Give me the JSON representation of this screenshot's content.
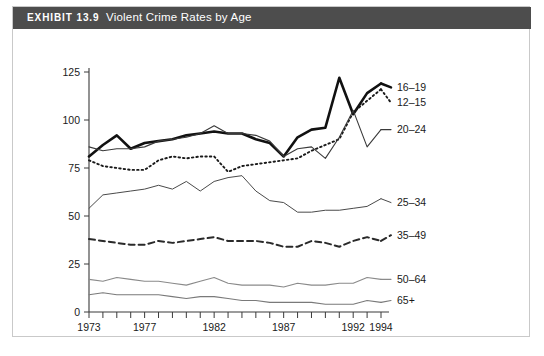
{
  "exhibit": {
    "label": "EXHIBIT 13.9",
    "name": "Violent Crime Rates by Age",
    "title_full": "EXHIBIT 13.9  Violent Crime Rates by Age",
    "header_bg": "#4d4d4d",
    "header_text_color": "#ffffff",
    "frame_border": "#c9c9c9",
    "page_bg": "#ffffff"
  },
  "chart_data": {
    "type": "line",
    "title": "Violent Crime Rates by Age",
    "xlabel": "",
    "ylabel": "",
    "xlim": [
      1973,
      1994
    ],
    "ylim": [
      0,
      125
    ],
    "yticks": [
      0,
      25,
      50,
      75,
      100,
      125
    ],
    "ytick_labels": [
      "0",
      "25",
      "50",
      "75",
      "100",
      "125"
    ],
    "x": [
      1973,
      1974,
      1975,
      1976,
      1977,
      1978,
      1979,
      1980,
      1981,
      1982,
      1983,
      1984,
      1985,
      1986,
      1987,
      1988,
      1989,
      1990,
      1991,
      1992,
      1993,
      1994
    ],
    "xticks": [
      1973,
      1974,
      1975,
      1976,
      1977,
      1978,
      1979,
      1980,
      1981,
      1982,
      1983,
      1984,
      1985,
      1986,
      1987,
      1988,
      1989,
      1990,
      1991,
      1992,
      1993,
      1994
    ],
    "xtick_labels_shown": [
      "1973",
      "1977",
      "1982",
      "1987",
      "1992",
      "1994"
    ],
    "xtick_labels_shown_at": [
      1973,
      1977,
      1982,
      1987,
      1992,
      1994
    ],
    "grid": false,
    "legend_position": "right-inline",
    "series": [
      {
        "name": "16–19",
        "label": "16–19",
        "style": "thick-solid",
        "color": "#111111",
        "width": 2.6,
        "dash": "none",
        "label_y_value": 117,
        "values": [
          81,
          87,
          92,
          85,
          88,
          89,
          90,
          92,
          93,
          94,
          93,
          93,
          90,
          88,
          81,
          91,
          95,
          96,
          122,
          103,
          114,
          119
        ]
      },
      {
        "name": "12–15",
        "label": "12–15",
        "style": "dotted",
        "color": "#1a1a1a",
        "width": 1.9,
        "dash": "1.5,3",
        "label_y_value": 109,
        "values": [
          79,
          76,
          75,
          74,
          74,
          79,
          81,
          80,
          81,
          81,
          73,
          76,
          77,
          78,
          79,
          80,
          84,
          87,
          90,
          104,
          110,
          116
        ]
      },
      {
        "name": "20–24",
        "label": "20–24",
        "style": "thin-solid",
        "color": "#3a3a3a",
        "width": 1.1,
        "dash": "none",
        "label_y_value": 95,
        "values": [
          86,
          84,
          85,
          85,
          86,
          89,
          90,
          91,
          93,
          97,
          93,
          93,
          92,
          89,
          81,
          85,
          86,
          80,
          91,
          105,
          86,
          95
        ]
      },
      {
        "name": "25–34",
        "label": "25–34",
        "style": "thin-solid",
        "color": "#4a4a4a",
        "width": 1.0,
        "dash": "none",
        "label_y_value": 57,
        "values": [
          54,
          61,
          62,
          63,
          64,
          66,
          64,
          68,
          63,
          68,
          70,
          71,
          63,
          58,
          57,
          52,
          52,
          53,
          53,
          54,
          55,
          59
        ]
      },
      {
        "name": "35–49",
        "label": "35–49",
        "style": "dashed",
        "color": "#2a2a2a",
        "width": 2.0,
        "dash": "6,4",
        "label_y_value": 40,
        "values": [
          38,
          37,
          36,
          35,
          35,
          37,
          36,
          37,
          38,
          39,
          37,
          37,
          37,
          36,
          34,
          34,
          37,
          36,
          34,
          37,
          39,
          37
        ]
      },
      {
        "name": "50–64",
        "label": "50–64",
        "style": "thin-solid-light",
        "color": "#8a8a8a",
        "width": 1.1,
        "dash": "none",
        "label_y_value": 17,
        "values": [
          17,
          16,
          18,
          17,
          16,
          16,
          15,
          14,
          16,
          18,
          15,
          14,
          14,
          14,
          13,
          15,
          14,
          14,
          15,
          15,
          18,
          17
        ]
      },
      {
        "name": "65+",
        "label": "65+",
        "style": "thin-solid-light",
        "color": "#7a7a7a",
        "width": 1.1,
        "dash": "none",
        "label_y_value": 6,
        "values": [
          9,
          10,
          9,
          9,
          9,
          9,
          8,
          7,
          8,
          8,
          7,
          6,
          6,
          5,
          5,
          5,
          5,
          4,
          4,
          4,
          6,
          5
        ]
      }
    ]
  },
  "footnote": {
    "ghost_text": ""
  }
}
